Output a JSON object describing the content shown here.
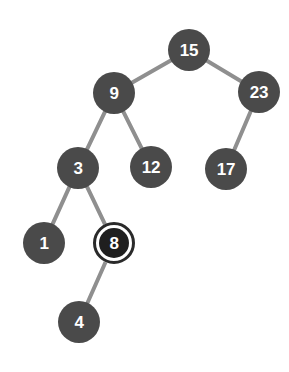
{
  "figure": {
    "kind": "binary-search-tree-diagram",
    "width": 289,
    "height": 372,
    "background_color": "#ffffff"
  },
  "style": {
    "node_fill": "#4a4a4a",
    "node_label_color": "#ffffff",
    "edge_color": "#8f8f8f",
    "highlight_ring_color": "#2a2a2a",
    "highlight_inner_fill": "#1f1f1f",
    "highlight_gap_color": "#ffffff",
    "edge_width": 4,
    "node_diameter": 42,
    "node_font_size": 17
  },
  "chart_data": {
    "type": "diagram",
    "title": "",
    "nodes": [
      {
        "id": "n15",
        "label": "15",
        "x": 189,
        "y": 50,
        "r": 21,
        "state": "normal"
      },
      {
        "id": "n9",
        "label": "9",
        "x": 114,
        "y": 93,
        "r": 21,
        "state": "normal"
      },
      {
        "id": "n23",
        "label": "23",
        "x": 259,
        "y": 92,
        "r": 21,
        "state": "normal"
      },
      {
        "id": "n3",
        "label": "3",
        "x": 78,
        "y": 168,
        "r": 21,
        "state": "normal"
      },
      {
        "id": "n12",
        "label": "12",
        "x": 151,
        "y": 167,
        "r": 21,
        "state": "normal"
      },
      {
        "id": "n17",
        "label": "17",
        "x": 226,
        "y": 169,
        "r": 21,
        "state": "normal"
      },
      {
        "id": "n1",
        "label": "1",
        "x": 44,
        "y": 243,
        "r": 21,
        "state": "normal"
      },
      {
        "id": "n8",
        "label": "8",
        "x": 114,
        "y": 243,
        "r": 21,
        "state": "highlighted"
      },
      {
        "id": "n4",
        "label": "4",
        "x": 79,
        "y": 322,
        "r": 21,
        "state": "normal"
      }
    ],
    "edges": [
      {
        "from": "n15",
        "to": "n9",
        "side": "left"
      },
      {
        "from": "n15",
        "to": "n23",
        "side": "right"
      },
      {
        "from": "n9",
        "to": "n3",
        "side": "left"
      },
      {
        "from": "n9",
        "to": "n12",
        "side": "right"
      },
      {
        "from": "n23",
        "to": "n17",
        "side": "left"
      },
      {
        "from": "n3",
        "to": "n1",
        "side": "left"
      },
      {
        "from": "n3",
        "to": "n8",
        "side": "right"
      },
      {
        "from": "n8",
        "to": "n4",
        "side": "left"
      }
    ],
    "root": "n15",
    "highlighted_node": "n8",
    "node_count": 9,
    "edge_count": 8,
    "depth": 4,
    "values_in_order": [
      1,
      3,
      4,
      8,
      9,
      12,
      15,
      17,
      23
    ]
  }
}
